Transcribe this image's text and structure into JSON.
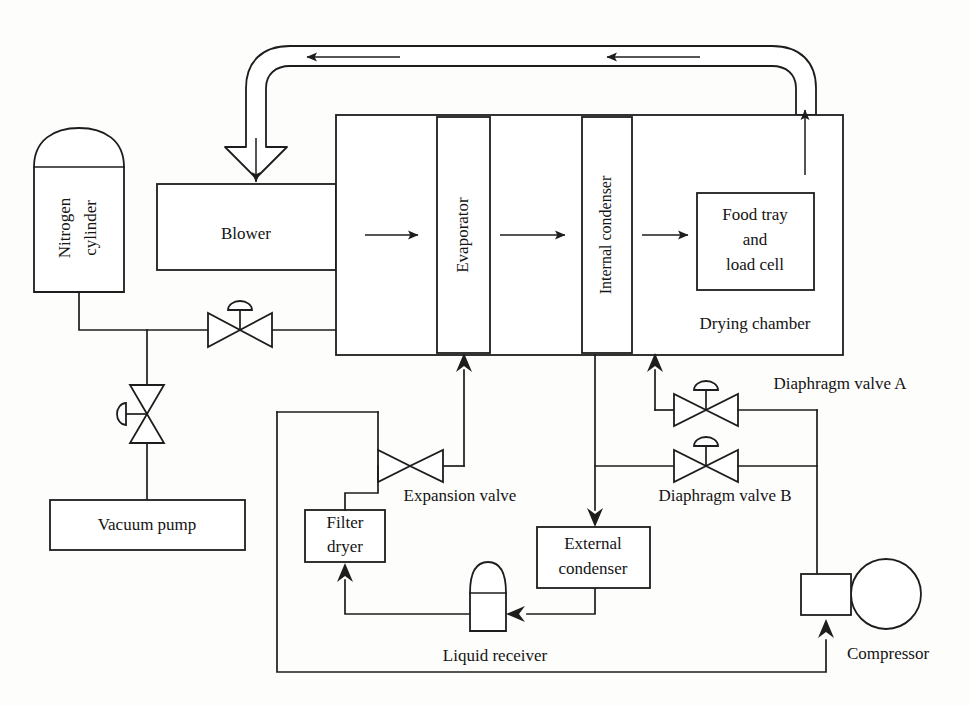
{
  "diagram": {
    "stroke_color": "#1d1d1d",
    "background_color": "#fdfdfb"
  },
  "components": {
    "nitrogen_cylinder": "Nitrogen\ncylinder",
    "nitrogen_cylinder_line1": "Nitrogen",
    "nitrogen_cylinder_line2": "cylinder",
    "vacuum_pump": "Vacuum pump",
    "blower": "Blower",
    "evaporator": "Evaporator",
    "internal_condenser": "Internal condenser",
    "food_tray_line1": "Food tray",
    "food_tray_line2": "and",
    "food_tray_line3": "load cell",
    "drying_chamber": "Drying chamber",
    "expansion_valve": "Expansion valve",
    "filter_dryer_line1": "Filter",
    "filter_dryer_line2": "dryer",
    "liquid_receiver": "Liquid receiver",
    "external_condenser_line1": "External",
    "external_condenser_line2": "condenser",
    "diaphragm_valve_a": "Diaphragm valve A",
    "diaphragm_valve_b": "Diaphragm valve B",
    "compressor": "Compressor"
  },
  "flow_symbols": {
    "air_duct_arrow": "hollow-duct-arrow",
    "blower_inlet_arrow": "down-arrow",
    "blower_to_evaporator_arrow": "right-arrow",
    "evaporator_to_condenser_arrow": "right-arrow",
    "condenser_to_tray_arrow": "right-arrow",
    "chamber_outlet_arrow": "up-arrow",
    "refrigerant_to_evaporator_arrow": "up-arrow",
    "refrigerant_to_internal_condenser_arrow": "up-arrow",
    "to_external_condenser_arrow": "down-arrow",
    "to_liquid_receiver_arrow": "left-arrow",
    "to_filter_dryer_arrow": "up-arrow",
    "to_compressor_arrow": "up-arrow"
  },
  "valves": {
    "nitrogen_supply_valve": "globe-valve-handle-top",
    "vacuum_line_valve": "globe-valve-handle-left",
    "expansion_valve_symbol": "bowtie-valve",
    "diaphragm_valve_a_symbol": "globe-valve-handle-top",
    "diaphragm_valve_b_symbol": "globe-valve-handle-top"
  }
}
